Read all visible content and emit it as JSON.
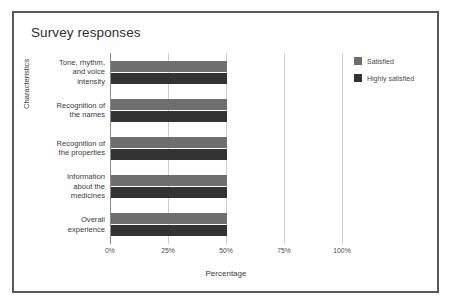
{
  "card": {
    "title": "Survey responses"
  },
  "legend": {
    "position": "right",
    "items": [
      {
        "label": "Satisfied",
        "color": "#6e6e6e"
      },
      {
        "label": "Highly satisfied",
        "color": "#333333"
      }
    ]
  },
  "axes": {
    "x_title": "Percentage",
    "y_title": "Characteristics",
    "x_ticks": [
      "0%",
      "25%",
      "50%",
      "75%",
      "100%"
    ]
  },
  "chart_data": {
    "type": "bar",
    "orientation": "horizontal",
    "title": "Survey responses",
    "xlabel": "Percentage",
    "ylabel": "Characteristics",
    "xlim": [
      0,
      100
    ],
    "xticks": [
      0,
      25,
      50,
      75,
      100
    ],
    "xticklabels": [
      "0%",
      "25%",
      "50%",
      "75%",
      "100%"
    ],
    "grid": true,
    "grid_axis": "x",
    "legend_position": "right",
    "categories": [
      "Tone, rhythm, and voice intensity",
      "Recognition of the names",
      "Recognition of the properties",
      "Information about the medicines",
      "Overall experience"
    ],
    "category_lines": [
      [
        "Tone, rhythm,",
        "and voice",
        "intensity"
      ],
      [
        "Recognition of",
        "the names"
      ],
      [
        "Recognition of",
        "the properties"
      ],
      [
        "Information",
        "about the",
        "medicines"
      ],
      [
        "Overall",
        "experience"
      ]
    ],
    "series": [
      {
        "name": "Satisfied",
        "color": "#6e6e6e",
        "values": [
          50,
          50,
          50,
          50,
          50
        ]
      },
      {
        "name": "Highly satisfied",
        "color": "#333333",
        "values": [
          50,
          50,
          50,
          50,
          50
        ]
      }
    ]
  }
}
